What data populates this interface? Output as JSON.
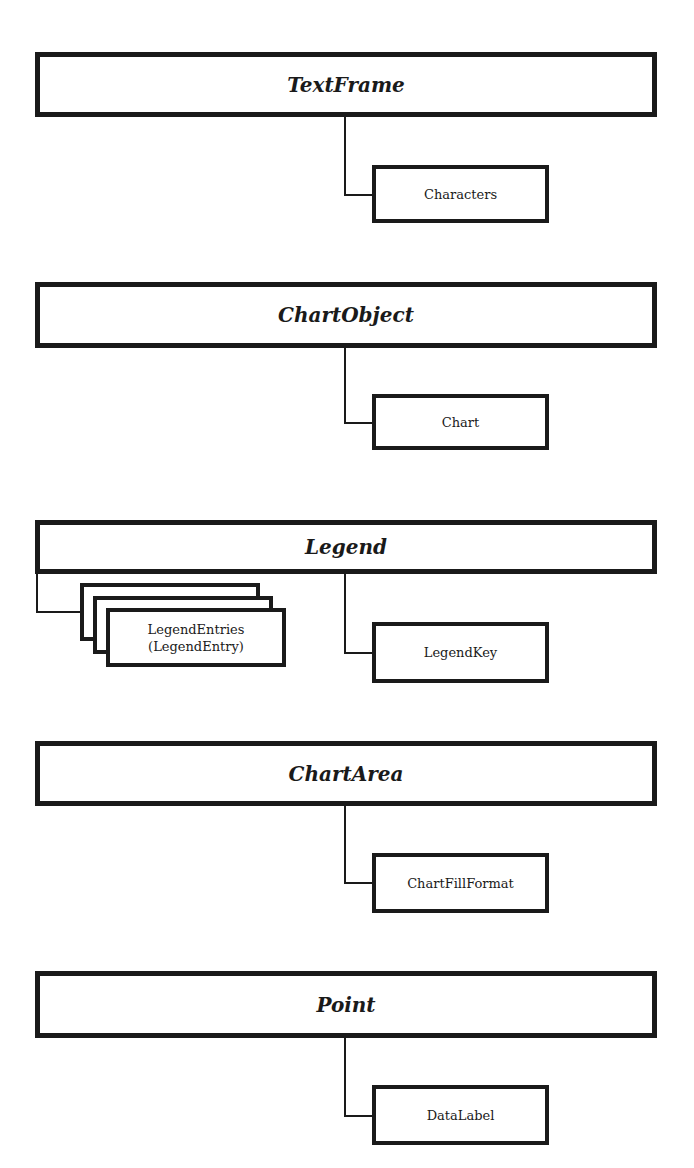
{
  "diagram": {
    "sections": [
      {
        "parent": "TextFrame",
        "children": [
          "Characters"
        ]
      },
      {
        "parent": "ChartObject",
        "children": [
          "Chart"
        ]
      },
      {
        "parent": "Legend",
        "collection": {
          "label_line1": "LegendEntries",
          "label_line2": "(LegendEntry)"
        },
        "children": [
          "LegendKey"
        ]
      },
      {
        "parent": "ChartArea",
        "children": [
          "ChartFillFormat"
        ]
      },
      {
        "parent": "Point",
        "children": [
          "DataLabel"
        ]
      }
    ]
  },
  "colors": {
    "stroke": "#1a1a1a",
    "background": "#ffffff"
  }
}
